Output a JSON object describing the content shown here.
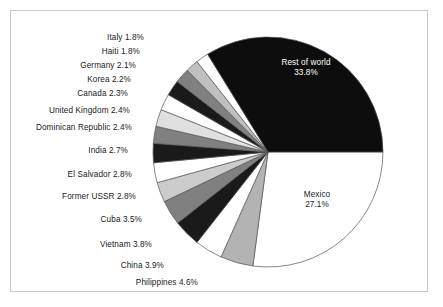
{
  "chart_data": {
    "type": "pie",
    "title": "",
    "subtitle": "",
    "xlabel": "",
    "ylabel": "",
    "legend_position": "none",
    "grid": false,
    "start_angle_deg": 0,
    "direction": "clockwise",
    "units": "percent",
    "categories": [
      "Mexico",
      "Philippines",
      "China",
      "Vietnam",
      "Cuba",
      "Former USSR",
      "El Salvador",
      "India",
      "Dominican Republic",
      "United Kingdom",
      "Canada",
      "Korea",
      "Germany",
      "Haiti",
      "Italy",
      "Rest of world"
    ],
    "values": [
      27.1,
      4.6,
      3.9,
      3.8,
      3.5,
      2.8,
      2.8,
      2.7,
      2.4,
      2.4,
      2.3,
      2.2,
      2.1,
      1.8,
      1.8,
      33.8
    ],
    "value_labels": [
      "27.1%",
      "4.6%",
      "3.9%",
      "3.8%",
      "3.5%",
      "2.8%",
      "2.8%",
      "2.7%",
      "2.4%",
      "2.4%",
      "2.3%",
      "2.2%",
      "2.1%",
      "1.8%",
      "1.8%",
      "33.8%"
    ],
    "slice_colors": [
      "#ffffff",
      "#b3b3b3",
      "#ffffff",
      "#1a1a1a",
      "#808080",
      "#cccccc",
      "#ffffff",
      "#1a1a1a",
      "#808080",
      "#e0e0e0",
      "#ffffff",
      "#1a1a1a",
      "#808080",
      "#c0c0c0",
      "#ffffff",
      "#0d0d0d"
    ],
    "outline_color": "#555555"
  },
  "labels": {
    "outside": [
      {
        "name": "italy",
        "text": "Italy 1.8%"
      },
      {
        "name": "haiti",
        "text": "Haiti 1.8%"
      },
      {
        "name": "germany",
        "text": "Germany 2.1%"
      },
      {
        "name": "korea",
        "text": "Korea 2.2%"
      },
      {
        "name": "canada",
        "text": "Canada 2.3%"
      },
      {
        "name": "united-kingdom",
        "text": "United Kingdom 2.4%"
      },
      {
        "name": "dominican-republic",
        "text": "Dominican Republic 2.4%"
      },
      {
        "name": "india",
        "text": "India 2.7%"
      },
      {
        "name": "el-salvador",
        "text": "El Salvador 2.8%"
      },
      {
        "name": "former-ussr",
        "text": "Former USSR 2.8%"
      },
      {
        "name": "cuba",
        "text": "Cuba 3.5%"
      },
      {
        "name": "vietnam",
        "text": "Vietnam 3.8%"
      },
      {
        "name": "china",
        "text": "China 3.9%"
      },
      {
        "name": "philippines",
        "text": "Philippines 4.6%"
      }
    ],
    "inside": {
      "rest_of_world_name": "Rest of world",
      "rest_of_world_value": "33.8%",
      "mexico_name": "Mexico",
      "mexico_value": "27.1%"
    }
  }
}
